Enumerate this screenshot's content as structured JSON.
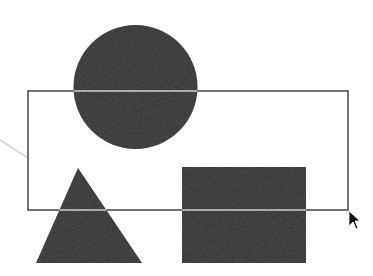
{
  "diagram": {
    "colors": {
      "background": "#ffffff",
      "shape_fill": "#2e2e2e",
      "outline_stroke": "#444444",
      "outline_over_shape": "#cfcfcf",
      "connector": "#d6d6d6",
      "cursor": "#111111"
    },
    "shapes": [
      {
        "type": "circle",
        "name": "circle",
        "cx": 135.5,
        "cy": 87,
        "r": 62
      },
      {
        "type": "triangle",
        "name": "triangle",
        "points": [
          [
            78,
            168
          ],
          [
            36,
            263
          ],
          [
            142,
            263
          ]
        ]
      },
      {
        "type": "rectangle",
        "name": "filled-rectangle",
        "x": 182,
        "y": 167,
        "width": 124,
        "height": 96
      }
    ],
    "selection_outline": {
      "x": 28,
      "y": 91,
      "width": 320,
      "height": 119
    },
    "connector_line": {
      "x1": 0,
      "y1": 140,
      "x2": 28,
      "y2": 158
    },
    "cursor": {
      "type": "arrow",
      "x": 349,
      "y": 211
    }
  }
}
